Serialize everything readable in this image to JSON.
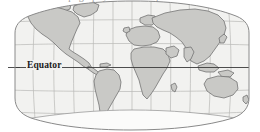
{
  "figure": {
    "caption_clipped": "the earth's topography. On the map is the Indian Ocean",
    "type": "world-map",
    "projection": "oval pseudocylindrical (Robinson-like)"
  },
  "map": {
    "equator_label": "Equator",
    "graticule": {
      "meridian_interval_deg": 30,
      "parallel_interval_deg": 30,
      "meridians_lon": [
        -180,
        -150,
        -120,
        -90,
        -60,
        -30,
        0,
        30,
        60,
        90,
        120,
        150,
        180
      ],
      "parallels_lat": [
        60,
        30,
        0,
        -30,
        -60
      ]
    },
    "colors": {
      "background": "#ffffff",
      "ocean": "#f2f2f0",
      "land": "#c9c9c6",
      "land_outline": "#6d6d6d",
      "graticule_line": "#b4b4b2",
      "equator_line": "#3a3a3a",
      "frame": "#8a8a8a",
      "antarctica": "#fbfbfa"
    },
    "landmasses": [
      "North America",
      "South America",
      "Greenland",
      "Europe",
      "Africa",
      "Asia",
      "Australia",
      "Antarctica"
    ]
  }
}
